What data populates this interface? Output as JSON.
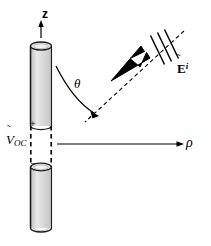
{
  "figure": {
    "background_color": "#ffffff",
    "stroke_color": "#000000",
    "cylinder_fill_light": "#f2f2f2",
    "cylinder_fill_mid": "#d6d6d6",
    "cylinder_fill_dark": "#b9b9b9",
    "labels": {
      "z_axis": "z",
      "theta": "θ",
      "rho_axis": "ρ",
      "voc_symbol": "V",
      "voc_tilde": "˜",
      "voc_subscript": "OC",
      "e_field_symbol": "E",
      "e_field_tilde": "˜",
      "e_field_superscript": "i",
      "terminal_plus": "+",
      "terminal_minus": "−"
    },
    "elements": {
      "antenna": "vertical-cylindrical-dipole",
      "gap": "dashed-feed-gap",
      "incident_ray": "dashed-line-with-three-hash-marks",
      "propagation_arrow": "thick-black-arrow-pointing-toward-antenna",
      "theta_arc": "curved-arrow-from-z-axis-to-incident-ray",
      "rho_arrow": "horizontal-arrow-pointing-right"
    },
    "geometry": {
      "antenna_center_x": 41,
      "antenna_top_y": 42,
      "antenna_bottom_y": 232,
      "gap_top_y": 126,
      "gap_bottom_y": 167,
      "ray_far_point": [
        184,
        31
      ],
      "ray_near_point": [
        86,
        121
      ],
      "hash_mark_count": 3
    }
  }
}
